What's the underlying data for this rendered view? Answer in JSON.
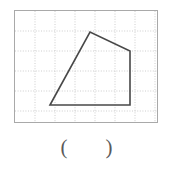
{
  "figure": {
    "name": "quadrilateral-on-dotted-grid",
    "panel": {
      "x": 14,
      "y": 10,
      "width": 144,
      "height": 113,
      "border_color": "#a9a9a9",
      "background_color": "#ffffff"
    },
    "grid": {
      "visible": true,
      "style": "dotted",
      "color": "#c8c8c8",
      "cell_size_px": 20,
      "columns": 7,
      "rows": 6,
      "vertical_lines_x": [
        20,
        40,
        60,
        80,
        100,
        120,
        140
      ],
      "horizontal_lines_y": [
        20,
        40,
        60,
        80,
        100
      ]
    },
    "shape": {
      "type": "polygon",
      "sides": 4,
      "label": "quadrilateral",
      "stroke_color": "#484848",
      "stroke_width": 1.6,
      "fill": "none",
      "vertices_px": [
        {
          "name": "bottom-left",
          "x": 35,
          "y": 94
        },
        {
          "name": "top",
          "x": 75,
          "y": 21
        },
        {
          "name": "right",
          "x": 115,
          "y": 40
        },
        {
          "name": "bottom-right",
          "x": 115,
          "y": 94
        }
      ],
      "vertices_grid": [
        {
          "name": "bottom-left",
          "col": 1.75,
          "row": 4.7
        },
        {
          "name": "top",
          "col": 3.75,
          "row": 1.05
        },
        {
          "name": "right",
          "col": 5.75,
          "row": 2.0
        },
        {
          "name": "bottom-right",
          "col": 5.75,
          "row": 4.7
        }
      ]
    }
  },
  "answer": {
    "open_paren": "(",
    "close_paren": ")",
    "value": "",
    "color": "#5a5a5a"
  }
}
